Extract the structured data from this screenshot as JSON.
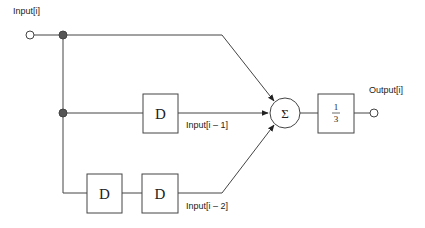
{
  "diagram": {
    "input_label": "Input[i]",
    "output_label": "Output[i]",
    "delay_symbol": "D",
    "sum_symbol": "Σ",
    "gain_numerator": "1",
    "gain_denominator": "3",
    "tap1_label": "Input[i – 1]",
    "tap2_label": "Input[i – 2]",
    "colors": {
      "line": "#444444",
      "node": "#555555",
      "box_fill": "#ffffff"
    }
  }
}
